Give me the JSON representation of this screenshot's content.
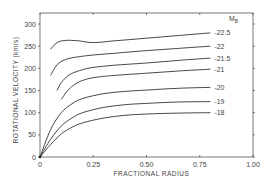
{
  "chart_data": {
    "type": "line",
    "title": "",
    "xlabel": "FRACTIONAL RADIUS",
    "ylabel": "ROTATIONAL VELOCITY (km/s)",
    "xlim": [
      0,
      1.0
    ],
    "ylim": [
      0,
      320
    ],
    "x_ticks": [
      0,
      0.25,
      0.5,
      0.75,
      1.0
    ],
    "x_tick_labels": [
      "0",
      "0.25",
      "0.50",
      "0.75",
      "1.00"
    ],
    "y_ticks": [
      0,
      50,
      100,
      150,
      200,
      250,
      300
    ],
    "y_tick_labels": [
      "0",
      "50",
      "100",
      "150",
      "200",
      "250",
      "300"
    ],
    "grid": false,
    "legend_title": "M_B",
    "legend_position": "right, inline labels at curve ends",
    "series": [
      {
        "name": "-22.5",
        "x": [
          0.05,
          0.08,
          0.12,
          0.18,
          0.25,
          0.35,
          0.5,
          0.65,
          0.8
        ],
        "values": [
          243,
          258,
          263,
          262,
          258,
          262,
          268,
          274,
          280
        ]
      },
      {
        "name": "-22",
        "x": [
          0.05,
          0.08,
          0.12,
          0.18,
          0.25,
          0.35,
          0.5,
          0.65,
          0.8
        ],
        "values": [
          184,
          208,
          220,
          226,
          230,
          234,
          240,
          245,
          250
        ]
      },
      {
        "name": "-21.5",
        "x": [
          0.08,
          0.1,
          0.14,
          0.2,
          0.25,
          0.35,
          0.5,
          0.65,
          0.8
        ],
        "values": [
          150,
          168,
          186,
          197,
          202,
          207,
          212,
          218,
          223
        ]
      },
      {
        "name": "-21",
        "x": [
          0.1,
          0.13,
          0.17,
          0.22,
          0.28,
          0.35,
          0.5,
          0.65,
          0.8
        ],
        "values": [
          130,
          150,
          166,
          176,
          181,
          184,
          189,
          194,
          198
        ]
      },
      {
        "name": "-20",
        "x": [
          0,
          0.05,
          0.1,
          0.15,
          0.2,
          0.3,
          0.4,
          0.5,
          0.65,
          0.8
        ],
        "values": [
          0,
          62,
          100,
          120,
          132,
          143,
          148,
          151,
          155,
          157
        ]
      },
      {
        "name": "-19",
        "x": [
          0,
          0.05,
          0.1,
          0.15,
          0.2,
          0.3,
          0.4,
          0.5,
          0.65,
          0.8
        ],
        "values": [
          0,
          40,
          70,
          88,
          100,
          112,
          118,
          121,
          124,
          125
        ]
      },
      {
        "name": "-18",
        "x": [
          0,
          0.05,
          0.1,
          0.15,
          0.2,
          0.3,
          0.4,
          0.5,
          0.65,
          0.8
        ],
        "values": [
          0,
          28,
          52,
          67,
          77,
          88,
          94,
          97,
          99,
          100
        ]
      }
    ],
    "annotations": [
      "M_B",
      "-22.5",
      "-22",
      "-21.5",
      "-21",
      "-20",
      "-19",
      "-18"
    ]
  }
}
